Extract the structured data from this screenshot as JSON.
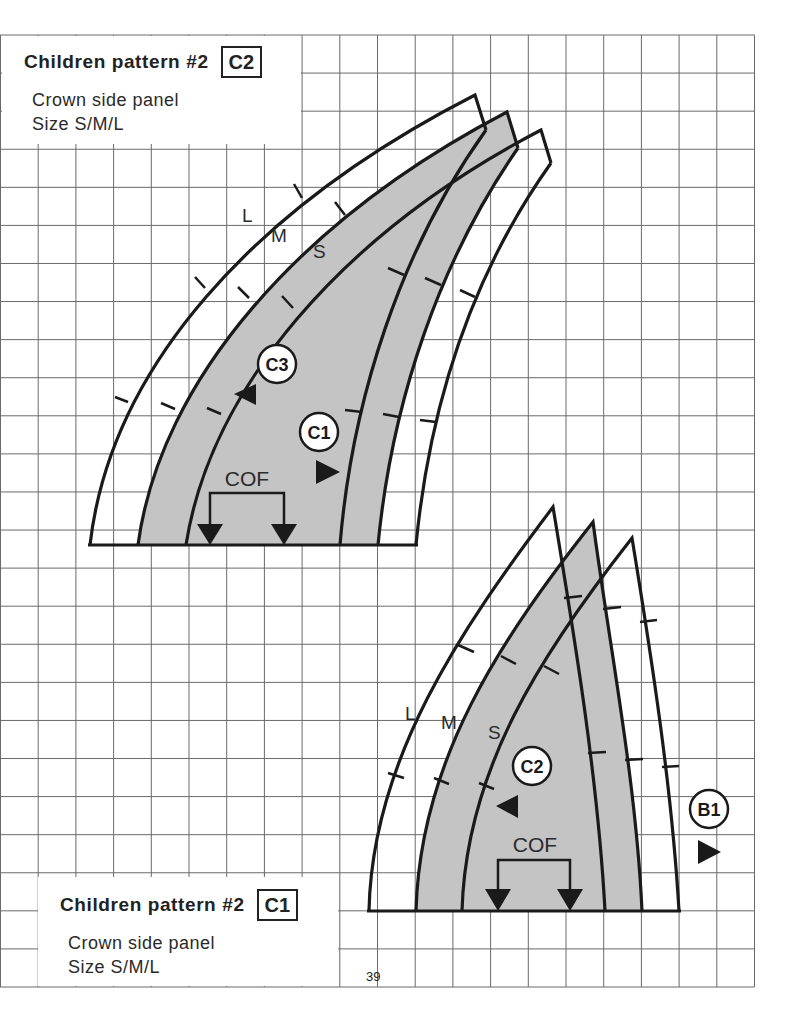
{
  "page": {
    "number": "39"
  },
  "patterns": [
    {
      "title": "Children pattern #2",
      "code": "C2",
      "description": "Crown side panel",
      "sizes_line": "Size S/M/L",
      "size_labels": [
        "L",
        "M",
        "S"
      ],
      "markers": [
        {
          "label": "C3",
          "arrow": "left"
        },
        {
          "label": "C1",
          "arrow": "right"
        }
      ],
      "fold_label": "COF"
    },
    {
      "title": "Children pattern #2",
      "code": "C1",
      "description": "Crown side panel",
      "sizes_line": "Size S/M/L",
      "size_labels": [
        "L",
        "M",
        "S"
      ],
      "markers": [
        {
          "label": "C2",
          "arrow": "left"
        },
        {
          "label": "B1",
          "arrow": "right"
        }
      ],
      "fold_label": "COF"
    }
  ],
  "colors": {
    "grid": "#6a6a6a",
    "outline": "#1a1a1a",
    "fill_medium": "#c4c4c4",
    "paper": "#ffffff"
  }
}
